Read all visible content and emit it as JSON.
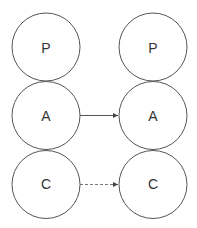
{
  "diagram": {
    "left_column": {
      "nodes": [
        {
          "label": "P"
        },
        {
          "label": "A"
        },
        {
          "label": "C"
        }
      ]
    },
    "right_column": {
      "nodes": [
        {
          "label": "P"
        },
        {
          "label": "A"
        },
        {
          "label": "C"
        }
      ]
    },
    "edges": [
      {
        "from": "left.A",
        "to": "right.A",
        "style": "solid",
        "arrow": true
      },
      {
        "from": "left.C",
        "to": "right.C",
        "style": "dashed",
        "arrow": true
      }
    ],
    "colors": {
      "stroke": "#555555",
      "text": "#333333",
      "background": "#ffffff"
    }
  }
}
